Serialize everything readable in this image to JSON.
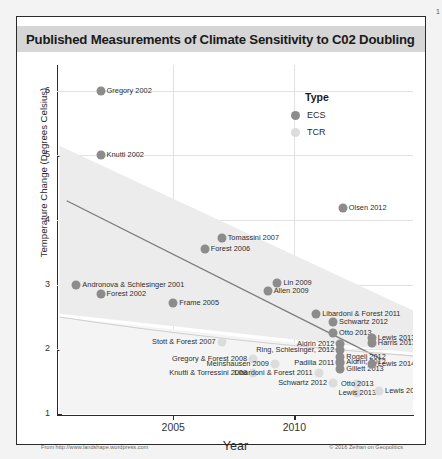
{
  "corner_number": "1",
  "chart_data": {
    "type": "scatter",
    "title": "Published Measurements of Climate Sensitivity to C02 Doubling",
    "xlabel": "Year",
    "ylabel": "Temperature Change (Degrees Celsius)",
    "xlim": [
      2000.2,
      2014.9
    ],
    "ylim": [
      1,
      6.4
    ],
    "xticks": [
      2005,
      2010
    ],
    "xtick_labels": [
      "2005",
      "2010"
    ],
    "yticks": [
      1,
      2,
      3,
      4,
      5,
      6
    ],
    "ytick_labels": [
      "1",
      "2",
      "3",
      "4",
      "5",
      "6"
    ],
    "grid": true,
    "legend": {
      "title": "Type",
      "position": "upper-right-inside",
      "entries": [
        {
          "name": "ECS",
          "color": "#8c8c8c"
        },
        {
          "name": "TCR",
          "color": "#dcdcdc"
        }
      ]
    },
    "trendline": {
      "note": "declining linear fit over ECS points",
      "x0": 2000.6,
      "y0": 4.3,
      "x1": 2013.6,
      "y1": 1.85,
      "color": "#7a7a7a"
    },
    "confidence_band": {
      "note": "shaded grey funnel narrowing to the right",
      "color": "#ececec"
    },
    "series": [
      {
        "name": "ECS",
        "color": "#8c8c8c",
        "points": [
          {
            "label": "Gregory 2002",
            "x": 2002.0,
            "y": 6.0,
            "label_pos": "right"
          },
          {
            "label": "Knutti 2002",
            "x": 2002.0,
            "y": 5.0,
            "label_pos": "right"
          },
          {
            "label": "Olsen 2012",
            "x": 2012.0,
            "y": 4.18,
            "label_pos": "right"
          },
          {
            "label": "Tomassini 2007",
            "x": 2007.0,
            "y": 3.72,
            "label_pos": "right"
          },
          {
            "label": "Forest 2006",
            "x": 2006.3,
            "y": 3.55,
            "label_pos": "right"
          },
          {
            "label": "Andronova & Schlesinger 2001",
            "x": 2001.0,
            "y": 3.0,
            "label_pos": "right"
          },
          {
            "label": "Forest 2002",
            "x": 2002.0,
            "y": 2.85,
            "label_pos": "right"
          },
          {
            "label": "Lin 2009",
            "x": 2009.3,
            "y": 3.03,
            "label_pos": "right"
          },
          {
            "label": "Allen 2009",
            "x": 2008.9,
            "y": 2.9,
            "label_pos": "right"
          },
          {
            "label": "Frame 2005",
            "x": 2005.0,
            "y": 2.72,
            "label_pos": "right"
          },
          {
            "label": "Libardoni & Forest 2011",
            "x": 2010.9,
            "y": 2.55,
            "label_pos": "right"
          },
          {
            "label": "Schwartz 2012",
            "x": 2011.6,
            "y": 2.42,
            "label_pos": "right"
          },
          {
            "label": "Otto 2013",
            "x": 2011.6,
            "y": 2.25,
            "label_pos": "right"
          },
          {
            "label": "Lewis 2013",
            "x": 2013.2,
            "y": 2.18,
            "label_pos": "right"
          },
          {
            "label": "Harris 2013",
            "x": 2013.2,
            "y": 2.1,
            "label_pos": "right"
          },
          {
            "label": "Aldrin 2012",
            "x": 2011.9,
            "y": 2.08,
            "label_pos": "left"
          },
          {
            "label": "Ring, Schlesinger, 2012",
            "x": 2011.9,
            "y": 1.99,
            "label_pos": "left"
          },
          {
            "label": "Rogelj 2012",
            "x": 2011.9,
            "y": 1.88,
            "label_pos": "right"
          },
          {
            "label": "Aldrin, 2012",
            "x": 2011.9,
            "y": 1.8,
            "label_pos": "right"
          },
          {
            "label": "Padilla 2011",
            "x": 2011.9,
            "y": 1.79,
            "label_pos": "left"
          },
          {
            "label": "Gillett 2013",
            "x": 2011.9,
            "y": 1.7,
            "label_pos": "right"
          },
          {
            "label": "Lewis 2014",
            "x": 2013.2,
            "y": 1.78,
            "label_pos": "right"
          }
        ]
      },
      {
        "name": "TCR",
        "color": "#dcdcdc",
        "points": [
          {
            "label": "Stott & Forest 2007",
            "x": 2007.0,
            "y": 2.12,
            "label_pos": "left"
          },
          {
            "label": "Gregory & Forest 2008",
            "x": 2008.3,
            "y": 1.85,
            "label_pos": "left"
          },
          {
            "label": "Meinshausen 2009",
            "x": 2009.2,
            "y": 1.78,
            "label_pos": "left"
          },
          {
            "label": "Knutti & Torressini 2008",
            "x": 2008.3,
            "y": 1.64,
            "label_pos": "left"
          },
          {
            "label": "Libardoni & Forest 2011",
            "x": 2011.0,
            "y": 1.64,
            "label_pos": "left"
          },
          {
            "label": "Schwartz 2012",
            "x": 2011.6,
            "y": 1.48,
            "label_pos": "left"
          },
          {
            "label": "Otto 2013",
            "x": 2012.6,
            "y": 1.47,
            "label_pos": "center"
          },
          {
            "label": "Lewis 2013",
            "x": 2012.6,
            "y": 1.33,
            "label_pos": "center"
          },
          {
            "label": "Lewis 2014",
            "x": 2013.5,
            "y": 1.35,
            "label_pos": "right"
          }
        ]
      }
    ]
  },
  "footer": {
    "left": "From http://www.landshape.wordpress.com",
    "right": "© 2016 Zeihan on Geopolitics"
  }
}
